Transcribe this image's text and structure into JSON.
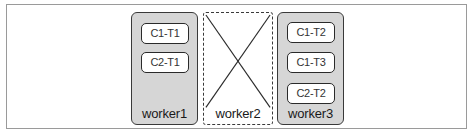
{
  "diagram": {
    "workers": [
      {
        "label": "worker1",
        "style": "solid",
        "tasks": [
          "C1-T1",
          "C2-T1"
        ]
      },
      {
        "label": "worker2",
        "style": "dashed-crossed",
        "tasks": []
      },
      {
        "label": "worker3",
        "style": "solid",
        "tasks": [
          "C1-T2",
          "C1-T3",
          "C2-T2"
        ]
      }
    ]
  },
  "colors": {
    "worker_fill": "#d6d6d6",
    "border": "#3a3a3a",
    "task_fill": "#ffffff",
    "frame_border": "#9a9a9a"
  }
}
